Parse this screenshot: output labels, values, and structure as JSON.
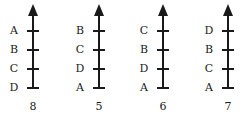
{
  "diagram": {
    "type": "ranking-scales",
    "tick_positions_y": [
      31,
      50,
      69,
      88
    ],
    "scales": [
      {
        "x": 33,
        "labels": [
          "A",
          "B",
          "C",
          "D"
        ],
        "number": "8"
      },
      {
        "x": 99,
        "labels": [
          "B",
          "C",
          "D",
          "A"
        ],
        "number": "5"
      },
      {
        "x": 163,
        "labels": [
          "C",
          "B",
          "D",
          "A"
        ],
        "number": "6"
      },
      {
        "x": 228,
        "labels": [
          "D",
          "B",
          "C",
          "A"
        ],
        "number": "7"
      }
    ],
    "colors": {
      "line": "#1a1a1a",
      "background": "#ffffff"
    }
  }
}
